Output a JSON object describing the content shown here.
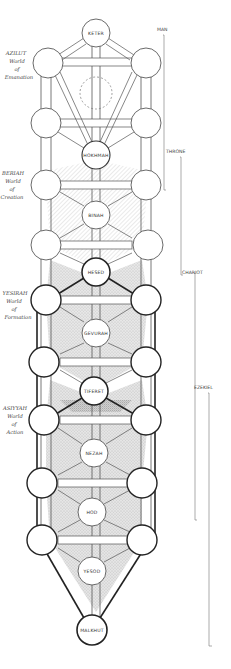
{
  "diagram": {
    "type": "kabbalistic-tree-of-life-ladder",
    "nodes": {
      "keter": "KETER",
      "hokhmah": "HOKHMAH",
      "binah": "BINAH",
      "hesed": "HESED",
      "gevurah": "GEVURAH",
      "tiferet": "TIFERET",
      "nezah": "NEZAH",
      "hod": "HOD",
      "yesod": "YESOD",
      "malkhut": "MALKHUT"
    },
    "worlds": [
      {
        "name": "AZILUT",
        "line1": "World",
        "line2": "of",
        "line3": "Emanation"
      },
      {
        "name": "BERIAH",
        "line1": "World",
        "line2": "of",
        "line3": "Creation"
      },
      {
        "name": "YESIRAH",
        "line1": "World",
        "line2": "of",
        "line3": "Formation"
      },
      {
        "name": "ASIYYAH",
        "line1": "World",
        "line2": "of",
        "line3": "Action"
      }
    ],
    "brackets": [
      {
        "label": "MAN"
      },
      {
        "label": "THRONE"
      },
      {
        "label": "CHARIOT"
      },
      {
        "label": "EZEKIEL"
      }
    ],
    "colors": {
      "ink": "#333333",
      "shading": "#c8c8c8",
      "background": "#ffffff"
    }
  }
}
